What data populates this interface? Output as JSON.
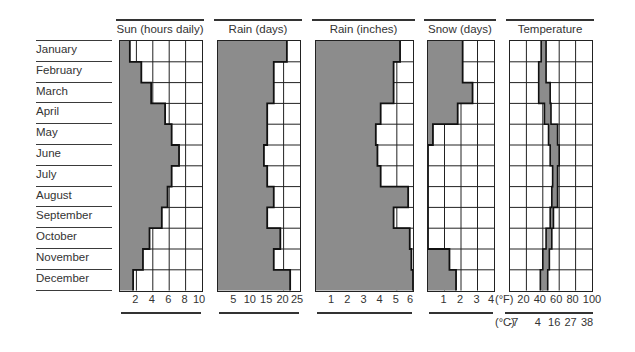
{
  "months": [
    "January",
    "February",
    "March",
    "April",
    "May",
    "June",
    "July",
    "August",
    "September",
    "October",
    "November",
    "December"
  ],
  "colors": {
    "shade": "#8c8c8c",
    "grid": "#222222",
    "edge": "#111111",
    "text": "#333333"
  },
  "panels": {
    "sun": {
      "title": "Sun (hours daily)",
      "ticks": [
        "2",
        "4",
        "6",
        "8",
        "10"
      ]
    },
    "rain_days": {
      "title": "Rain (days)",
      "ticks": [
        "5",
        "10",
        "15",
        "20",
        "25"
      ]
    },
    "rain_inches": {
      "title": "Rain (inches)",
      "ticks": [
        "1",
        "2",
        "3",
        "4",
        "5",
        "6"
      ]
    },
    "snow": {
      "title": "Snow (days)",
      "ticks": [
        "1",
        "2",
        "3",
        "4"
      ]
    },
    "temp": {
      "title": "Temperature",
      "unit_f": "(°F)",
      "unit_c": "(°C)",
      "ticks_f": [
        "20",
        "40",
        "60",
        "80",
        "100"
      ],
      "ticks_c": [
        "-7",
        "4",
        "16",
        "27",
        "38"
      ]
    }
  },
  "chart_data": [
    {
      "type": "bar",
      "orientation": "horizontal",
      "title": "Sun (hours daily)",
      "categories": [
        "January",
        "February",
        "March",
        "April",
        "May",
        "June",
        "July",
        "August",
        "September",
        "October",
        "November",
        "December"
      ],
      "values": [
        1.2,
        2.6,
        3.8,
        5.5,
        6.3,
        7.2,
        6.3,
        5.8,
        5.1,
        3.6,
        2.8,
        1.6
      ],
      "xlim": [
        0,
        10
      ],
      "xticks": [
        2,
        4,
        6,
        8,
        10
      ],
      "grid": true
    },
    {
      "type": "bar",
      "orientation": "horizontal",
      "title": "Rain (days)",
      "categories": [
        "January",
        "February",
        "March",
        "April",
        "May",
        "June",
        "July",
        "August",
        "September",
        "October",
        "November",
        "December"
      ],
      "values": [
        21,
        17,
        17,
        15,
        15,
        14,
        15,
        17,
        15,
        19,
        17,
        22
      ],
      "xlim": [
        0,
        25
      ],
      "xticks": [
        5,
        10,
        15,
        20,
        25
      ],
      "grid": true
    },
    {
      "type": "bar",
      "orientation": "horizontal",
      "title": "Rain (inches)",
      "categories": [
        "January",
        "February",
        "March",
        "April",
        "May",
        "June",
        "July",
        "August",
        "September",
        "October",
        "November",
        "December"
      ],
      "values": [
        5.2,
        4.8,
        4.8,
        4.0,
        3.7,
        3.8,
        4.0,
        5.7,
        4.8,
        5.8,
        5.9,
        6.0
      ],
      "xlim": [
        0,
        6
      ],
      "xticks": [
        1,
        2,
        3,
        4,
        5,
        6
      ],
      "grid": true
    },
    {
      "type": "bar",
      "orientation": "horizontal",
      "title": "Snow (days)",
      "categories": [
        "January",
        "February",
        "March",
        "April",
        "May",
        "June",
        "July",
        "August",
        "September",
        "October",
        "November",
        "December"
      ],
      "values": [
        2.1,
        2.1,
        2.7,
        1.8,
        0.3,
        0,
        0,
        0,
        0,
        0,
        1.3,
        1.7
      ],
      "xlim": [
        0,
        4
      ],
      "xticks": [
        1,
        2,
        3,
        4
      ],
      "grid": true
    },
    {
      "type": "range_bar",
      "orientation": "horizontal",
      "title": "Temperature",
      "categories": [
        "January",
        "February",
        "March",
        "April",
        "May",
        "June",
        "July",
        "August",
        "September",
        "October",
        "November",
        "December"
      ],
      "series": [
        {
          "name": "low_F",
          "values": [
            38,
            35,
            35,
            42,
            47,
            49,
            52,
            51,
            49,
            44,
            40,
            37
          ]
        },
        {
          "name": "high_F",
          "values": [
            44,
            44,
            49,
            50,
            58,
            60,
            58,
            58,
            53,
            51,
            48,
            46
          ]
        }
      ],
      "xlim": [
        0,
        100
      ],
      "xticks_F": [
        20,
        40,
        60,
        80,
        100
      ],
      "xticks_C": [
        -7,
        4,
        16,
        27,
        38
      ],
      "xlabel_F": "(°F)",
      "xlabel_C": "(°C)",
      "grid": true
    }
  ]
}
